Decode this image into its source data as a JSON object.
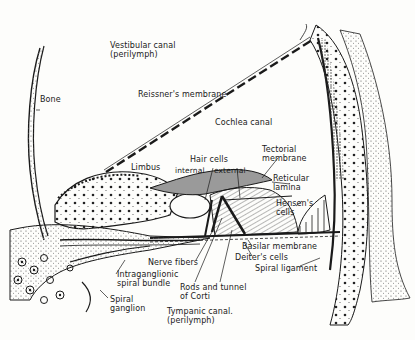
{
  "diagram": {
    "labels": {
      "vestibular_canal": "Vestibular canal\n(perilymph)",
      "bone": "Bone",
      "reissners_membrane": "Reissner's membrane",
      "cochlea_canal": "Cochlea canal",
      "limbus": "Limbus",
      "hair_cells": "Hair cells",
      "internal": "internal",
      "external": "external",
      "tectorial_membrane": "Tectorial\nmembrane",
      "reticular_lamina": "Reticular\nlamina",
      "hensens_cells": "Hensen's\ncells",
      "basilar_membrane": "Basilar membrane",
      "deiters_cells": "Deiter's cells",
      "spiral_ligament": "Spiral ligament",
      "nerve_fibers": "Nerve fibers",
      "intraganglionic_spiral_bundle": "Intraganglionic\nspiral bundle",
      "rods_and_tunnel_of_corti": "Rods and tunnel\nof Corti",
      "spiral_ganglion": "Spiral\nganglion",
      "tympanic_canal": "Tympanic canal.\n(perilymph)"
    },
    "colors": {
      "ink": "#1a1a1a",
      "paper": "#fdfdfb",
      "stipple": "#444444"
    }
  }
}
